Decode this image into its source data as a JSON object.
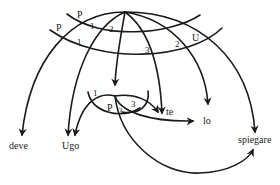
{
  "diagram": {
    "words": {
      "deve": "deve",
      "ugo": "Ugo",
      "te": "te",
      "lo": "lo",
      "spiegare": "spiegare"
    },
    "top_labels": {
      "p_upper": "P",
      "p_lower": "P",
      "one_upper": "1",
      "two_upper": "2",
      "one_lower": "1",
      "three": "3",
      "two_right": "2",
      "u": "U"
    },
    "inner_labels": {
      "one": "1",
      "p": "P",
      "two": "2",
      "three": "3"
    },
    "stroke_color": "#1a1a1a"
  }
}
